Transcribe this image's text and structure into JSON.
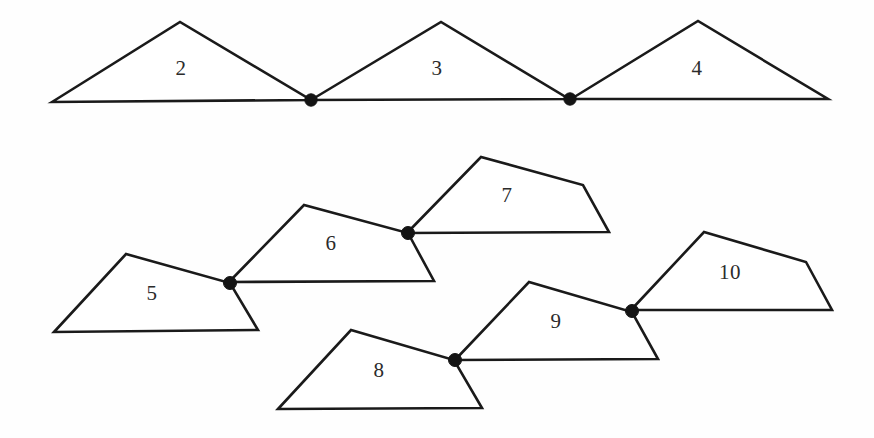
{
  "figure": {
    "background_color": "#fefefe",
    "stroke_color": "#1a1a1a",
    "label_color": "#2b2b2b",
    "dot_color": "#141414",
    "width": 874,
    "height": 438
  },
  "chart_data": {
    "type": "diagram",
    "xlabel": "",
    "ylabel": "",
    "coordinate_space": "pixels, origin top-left, 874x438",
    "rows": [
      {
        "row_name": "top-row-triangles",
        "shape_labels": [
          "2",
          "3",
          "4"
        ]
      },
      {
        "row_name": "bottom-row-quadrilaterals",
        "shape_labels": [
          "5",
          "6",
          "7",
          "8",
          "9",
          "10"
        ]
      }
    ],
    "polygons": [
      {
        "label": "2",
        "sides": 3,
        "points": "52,102 180,22 311,100",
        "label_x": 181,
        "label_y": 70
      },
      {
        "label": "3",
        "sides": 3,
        "points": "311,100 441,22 569,99",
        "label_x": 437,
        "label_y": 70
      },
      {
        "label": "4",
        "sides": 3,
        "points": "571,99 698,21 828,99",
        "label_x": 697,
        "label_y": 70
      },
      {
        "label": "5",
        "sides": 4,
        "points": "54,332 126,254 230,283 258,330",
        "label_x": 152,
        "label_y": 295
      },
      {
        "label": "6",
        "sides": 4,
        "points": "229,282 304,205 408,233 434,281",
        "label_x": 331,
        "label_y": 245
      },
      {
        "label": "7",
        "sides": 4,
        "points": "407,233 481,157 583,185 609,232",
        "label_x": 507,
        "label_y": 197
      },
      {
        "label": "8",
        "sides": 4,
        "points": "278,409 351,330 454,360 482,408",
        "label_x": 379,
        "label_y": 372
      },
      {
        "label": "9",
        "sides": 4,
        "points": "455,360 529,282 632,312 658,359",
        "label_x": 556,
        "label_y": 323
      },
      {
        "label": "10",
        "sides": 4,
        "points": "631,310 704,232 806,262 832,310",
        "label_x": 730,
        "label_y": 274
      }
    ],
    "shared_vertices": [
      {
        "name": "joint-2-3",
        "x": 311,
        "y": 100,
        "radius": 6.2,
        "joins": [
          "2",
          "3"
        ]
      },
      {
        "name": "joint-3-4",
        "x": 570,
        "y": 99,
        "radius": 6.2,
        "joins": [
          "3",
          "4"
        ]
      },
      {
        "name": "joint-5-6",
        "x": 230,
        "y": 283,
        "radius": 6.5,
        "joins": [
          "5",
          "6"
        ]
      },
      {
        "name": "joint-6-7",
        "x": 408,
        "y": 233,
        "radius": 6.5,
        "joins": [
          "6",
          "7"
        ]
      },
      {
        "name": "joint-8-9",
        "x": 455,
        "y": 360,
        "radius": 6.5,
        "joins": [
          "8",
          "9"
        ]
      },
      {
        "name": "joint-9-10",
        "x": 632,
        "y": 311,
        "radius": 6.5,
        "joins": [
          "9",
          "10"
        ]
      }
    ]
  }
}
